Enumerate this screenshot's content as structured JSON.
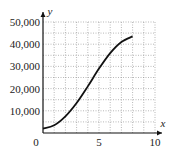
{
  "chart_data": {
    "type": "line",
    "title": "",
    "xlabel": "x",
    "ylabel": "y",
    "xlim": [
      0,
      10
    ],
    "ylim": [
      0,
      50000
    ],
    "grid": true,
    "x_ticks": [
      "0",
      "5",
      "10"
    ],
    "y_ticks": [
      "10,000",
      "20,000",
      "30,000",
      "40,000",
      "50,000"
    ],
    "series": [
      {
        "name": "y",
        "x": [
          0,
          1,
          2,
          3,
          4,
          5,
          6,
          7,
          8
        ],
        "values": [
          2000,
          3500,
          7500,
          13500,
          21000,
          29000,
          36000,
          41000,
          43500
        ]
      }
    ]
  }
}
